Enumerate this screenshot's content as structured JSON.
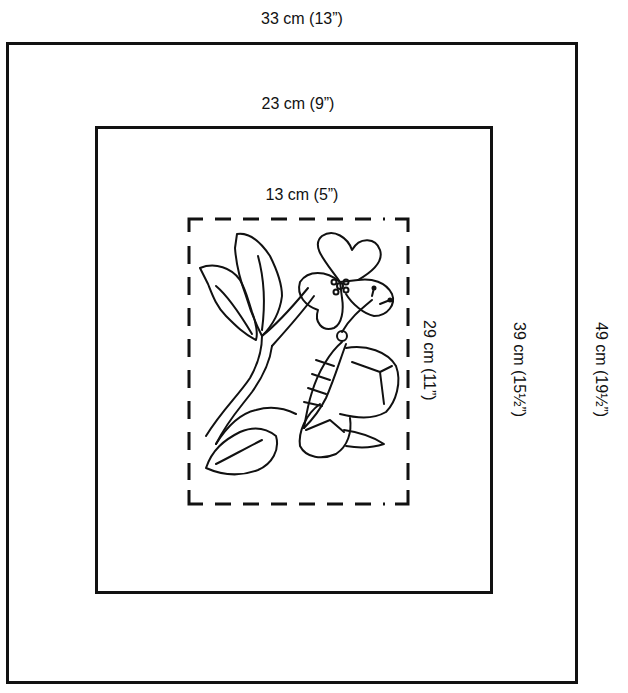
{
  "diagram": {
    "type": "embroidery-pattern-dimension-diagram",
    "frames": [
      {
        "name": "outer",
        "width_label": "33 cm (13”)",
        "height_label": "49 cm (19½”)",
        "style": "solid"
      },
      {
        "name": "middle",
        "width_label": "23 cm (9”)",
        "height_label": "39 cm (15½”)",
        "style": "solid"
      },
      {
        "name": "inner",
        "width_label": "13 cm (5”)",
        "height_label": "29 cm (11”)",
        "style": "dashed"
      }
    ],
    "illustration": "flower-and-butterfly-line-art",
    "colors": {
      "line": "#111111",
      "background": "#ffffff"
    }
  }
}
